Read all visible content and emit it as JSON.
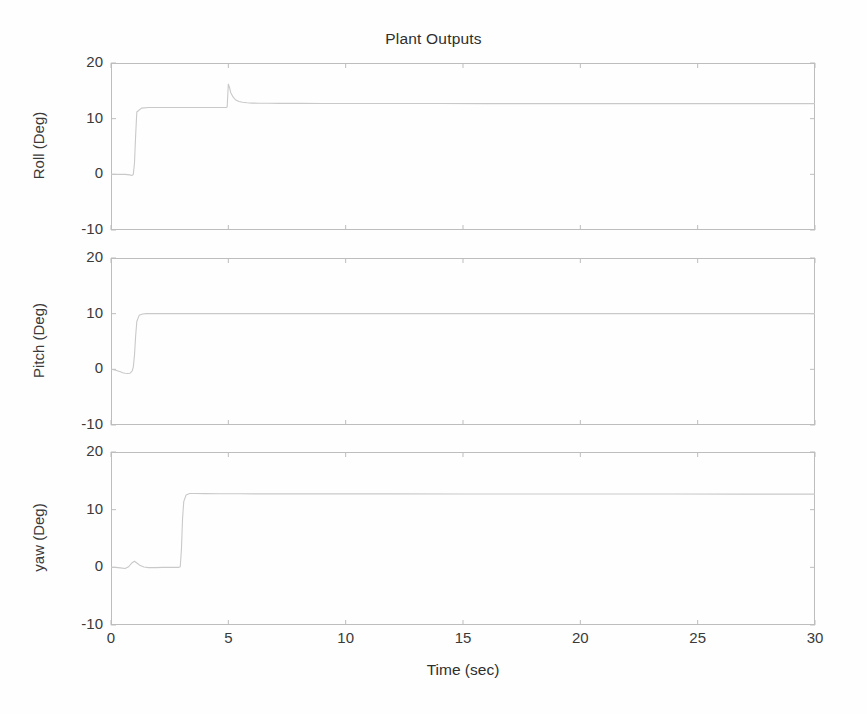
{
  "figure": {
    "title": "Plant Outputs",
    "xlabel": "Time (sec)",
    "background_color": "#fefefe",
    "line_color": "#c9c9c9",
    "axis_color": "#bdbdbd",
    "text_color": "#3a3a3a"
  },
  "xaxis": {
    "ticks": [
      0,
      5,
      10,
      15,
      20,
      25,
      30
    ],
    "tick_labels": [
      "0",
      "5",
      "10",
      "15",
      "20",
      "25",
      "30"
    ],
    "min": 0,
    "max": 30,
    "label": "Time (sec)"
  },
  "yaxis": {
    "ticks": [
      -10,
      0,
      10,
      20
    ],
    "tick_labels": [
      "-10",
      "0",
      "10",
      "20"
    ],
    "min": -10,
    "max": 20
  },
  "chart_data": [
    {
      "type": "line",
      "title": "Plant Outputs",
      "subplot_index": 0,
      "name": "Roll",
      "ylabel": "Roll (Deg)",
      "xlabel": "",
      "xlim": [
        0,
        30
      ],
      "ylim": [
        -10,
        20
      ],
      "xticks": [
        0,
        5,
        10,
        15,
        20,
        25,
        30
      ],
      "yticks": [
        -10,
        0,
        10,
        20
      ],
      "grid": false,
      "legend": "none",
      "series": [
        {
          "name": "Roll (Deg)",
          "x": [
            0,
            0.2,
            0.4,
            0.6,
            0.8,
            0.9,
            0.95,
            1.0,
            1.05,
            1.1,
            1.3,
            1.6,
            2.0,
            2.5,
            3.0,
            3.5,
            4.0,
            4.5,
            4.9,
            4.95,
            5.0,
            5.05,
            5.1,
            5.2,
            5.3,
            5.45,
            5.6,
            5.8,
            6.0,
            6.3,
            6.7,
            7.2,
            8.0,
            9.0,
            10.0,
            12.0,
            14.0,
            16.0,
            18.0,
            20.0,
            22.0,
            24.0,
            26.0,
            28.0,
            30.0
          ],
          "y": [
            0,
            0,
            0,
            0,
            -0.1,
            -0.2,
            0.0,
            2.0,
            7.0,
            11.2,
            11.9,
            12.0,
            12.0,
            12.0,
            12.0,
            12.0,
            12.0,
            12.0,
            12.0,
            12.1,
            16.2,
            15.6,
            14.7,
            13.9,
            13.4,
            13.1,
            12.95,
            12.85,
            12.8,
            12.78,
            12.76,
            12.75,
            12.74,
            12.73,
            12.73,
            12.72,
            12.72,
            12.71,
            12.71,
            12.7,
            12.7,
            12.7,
            12.7,
            12.7,
            12.7
          ]
        }
      ]
    },
    {
      "type": "line",
      "subplot_index": 1,
      "name": "Pitch",
      "ylabel": "Pitch (Deg)",
      "xlabel": "",
      "xlim": [
        0,
        30
      ],
      "ylim": [
        -10,
        20
      ],
      "xticks": [
        0,
        5,
        10,
        15,
        20,
        25,
        30
      ],
      "yticks": [
        -10,
        0,
        10,
        20
      ],
      "grid": false,
      "legend": "none",
      "series": [
        {
          "name": "Pitch (Deg)",
          "x": [
            0,
            0.2,
            0.4,
            0.5,
            0.6,
            0.7,
            0.8,
            0.85,
            0.9,
            0.95,
            1.0,
            1.05,
            1.1,
            1.2,
            1.35,
            1.5,
            1.8,
            2.2,
            3.0,
            4.0,
            5.0,
            7.0,
            10.0,
            13.0,
            16.0,
            20.0,
            24.0,
            27.0,
            30.0
          ],
          "y": [
            0,
            -0.15,
            -0.45,
            -0.6,
            -0.7,
            -0.75,
            -0.7,
            -0.55,
            -0.3,
            0.4,
            2.5,
            6.0,
            8.6,
            9.7,
            9.95,
            10.0,
            10.0,
            10.0,
            10.0,
            10.0,
            10.0,
            10.0,
            10.0,
            10.0,
            10.0,
            10.0,
            10.0,
            10.0,
            10.0
          ]
        }
      ]
    },
    {
      "type": "line",
      "subplot_index": 2,
      "name": "yaw",
      "ylabel": "yaw (Deg)",
      "xlabel": "Time (sec)",
      "xlim": [
        0,
        30
      ],
      "ylim": [
        -10,
        20
      ],
      "xticks": [
        0,
        5,
        10,
        15,
        20,
        25,
        30
      ],
      "yticks": [
        -10,
        0,
        10,
        20
      ],
      "grid": false,
      "legend": "none",
      "series": [
        {
          "name": "yaw (Deg)",
          "x": [
            0,
            0.2,
            0.4,
            0.6,
            0.75,
            0.9,
            1.0,
            1.1,
            1.25,
            1.4,
            1.6,
            1.9,
            2.2,
            2.6,
            2.9,
            2.95,
            3.0,
            3.05,
            3.1,
            3.2,
            3.35,
            3.6,
            4.0,
            4.6,
            5.5,
            7.0,
            9.0,
            12.0,
            15.0,
            18.0,
            21.0,
            24.0,
            27.0,
            30.0
          ],
          "y": [
            0,
            0.0,
            -0.1,
            -0.2,
            0.1,
            0.8,
            1.05,
            0.75,
            0.3,
            0.05,
            -0.05,
            -0.05,
            0.0,
            0.0,
            0.0,
            0.1,
            3.0,
            8.5,
            11.4,
            12.55,
            12.8,
            12.8,
            12.78,
            12.76,
            12.75,
            12.74,
            12.73,
            12.73,
            12.72,
            12.72,
            12.71,
            12.71,
            12.7,
            12.7
          ]
        }
      ]
    }
  ],
  "subplot_geometry": [
    {
      "top": 63,
      "height": 167
    },
    {
      "top": 258,
      "height": 167
    },
    {
      "top": 452,
      "height": 173
    }
  ]
}
